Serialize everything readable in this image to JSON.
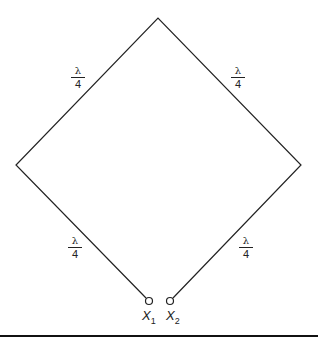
{
  "diagram": {
    "type": "quarter-wave transmission line loop (diamond)",
    "segments": [
      {
        "position": "upper-left",
        "label_num": "λ",
        "label_den": "4"
      },
      {
        "position": "upper-right",
        "label_num": "λ",
        "label_den": "4"
      },
      {
        "position": "lower-left",
        "label_num": "λ",
        "label_den": "4"
      },
      {
        "position": "lower-right",
        "label_num": "λ",
        "label_den": "4"
      }
    ],
    "terminals": [
      {
        "label": "X",
        "subscript": "1"
      },
      {
        "label": "X",
        "subscript": "2"
      }
    ],
    "colors": {
      "line": "#222222",
      "background": "#ffffff"
    }
  }
}
